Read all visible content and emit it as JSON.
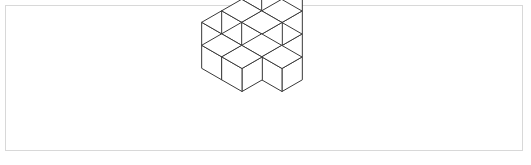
{
  "figure": {
    "type": "isometric-cube-stack",
    "title": "",
    "caption": "",
    "frame": {
      "x": 5,
      "y": 5,
      "width": 518,
      "height": 146,
      "border_color": "#d8d8d8",
      "background_color": "#ffffff"
    },
    "render": {
      "origin_x": 262,
      "origin_y": 34,
      "half_width": 20,
      "half_depth": 11.5,
      "cube_height": 23,
      "line_color": "#3a3a3a",
      "line_width": 1,
      "top_face_color": "#ffffff",
      "left_face_color": "#ffffff",
      "right_face_color": "#ffffff"
    },
    "cube_count": 14,
    "cubes": [
      {
        "x": 0,
        "y": 0,
        "z": 2
      },
      {
        "x": 1,
        "y": 0,
        "z": 2
      },
      {
        "x": 0,
        "y": 0,
        "z": 1
      },
      {
        "x": 1,
        "y": 0,
        "z": 1
      },
      {
        "x": 0,
        "y": 1,
        "z": 1
      },
      {
        "x": 1,
        "y": 1,
        "z": 1
      },
      {
        "x": 0,
        "y": 0,
        "z": 0
      },
      {
        "x": 1,
        "y": 0,
        "z": 0
      },
      {
        "x": 0,
        "y": 1,
        "z": 0
      },
      {
        "x": 1,
        "y": 1,
        "z": 0
      },
      {
        "x": 2,
        "y": 1,
        "z": 0
      },
      {
        "x": 0,
        "y": 2,
        "z": 0
      },
      {
        "x": 1,
        "y": 2,
        "z": 0
      },
      {
        "x": -1,
        "y": 1,
        "z": 0
      }
    ]
  }
}
